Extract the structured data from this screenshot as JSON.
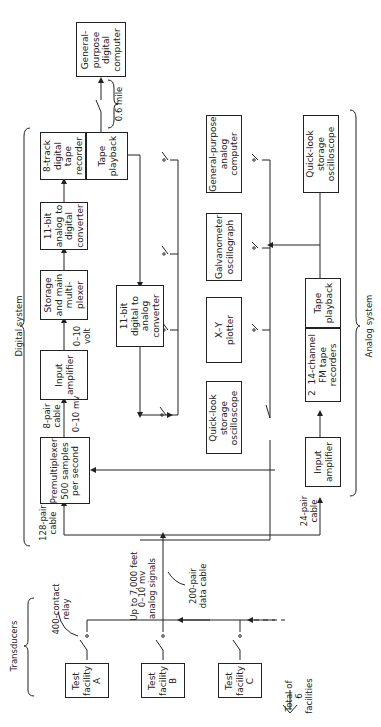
{
  "figure": {
    "orientation": "rotated-90-ccw",
    "group_labels": {
      "digital_system": "Digital system",
      "analog_system": "Analog system",
      "transducers": "Transducers"
    },
    "blocks": {
      "gp_digital_computer": "General-\npurpose\ndigital\ncomputer",
      "digital_tape_recorder": "8-track\ndigital\ntape\nrecorder",
      "digital_tape_playback": "Tape\nplayback",
      "adc": "11-bit\nanalog to\ndigital\nconverter",
      "storage_mux": "Storage\nand main\nmulti-\nplexer",
      "input_amplifier_digital": "Input\namplifier",
      "premultiplexer": "Premultiplexer\n500 samples\nper second",
      "dac": "11-bit\ndigital to\nanalog\nconverter",
      "gp_analog_computer": "General-purpose\nanalog\ncomputer",
      "galvanometer": "Galvanometer\noscillograph",
      "xy_plotter": "X–Y\nplotter",
      "quicklook_digital": "Quick-look\nstorage\noscilloscope",
      "quicklook_analog": "Quick-look\nstorage\noscilloscope",
      "fm_recorders": "2  14-channel\nFM tape\nrecorders",
      "analog_tape_playback": "Tape\nplayback",
      "input_amplifier_analog": "Input\namplifier",
      "test_facility_a": "Test\nfacility\nA",
      "test_facility_b": "Test\nfacility\nB",
      "test_facility_c": "Test\nfacility\nC"
    },
    "annotations": {
      "distance_0_6_mile": "0.6 mile",
      "volt_0_10": "0–10\nvolt",
      "cable_8_pair": "8-pair\ncable",
      "mv_0_10": "0–10 mv",
      "cable_128_pair": "128-pair\ncable",
      "cable_24_pair": "24-pair\ncable",
      "up_to_7000_feet": "Up to 7,000 feet",
      "analog_signals": "0–10 mv\nanalog signals",
      "data_cable_200_pair": "200-pair\ndata cable",
      "relay_400_contact": "400-contact\nrelay",
      "total_facilities": "Total of\n6\nfacilities"
    }
  }
}
